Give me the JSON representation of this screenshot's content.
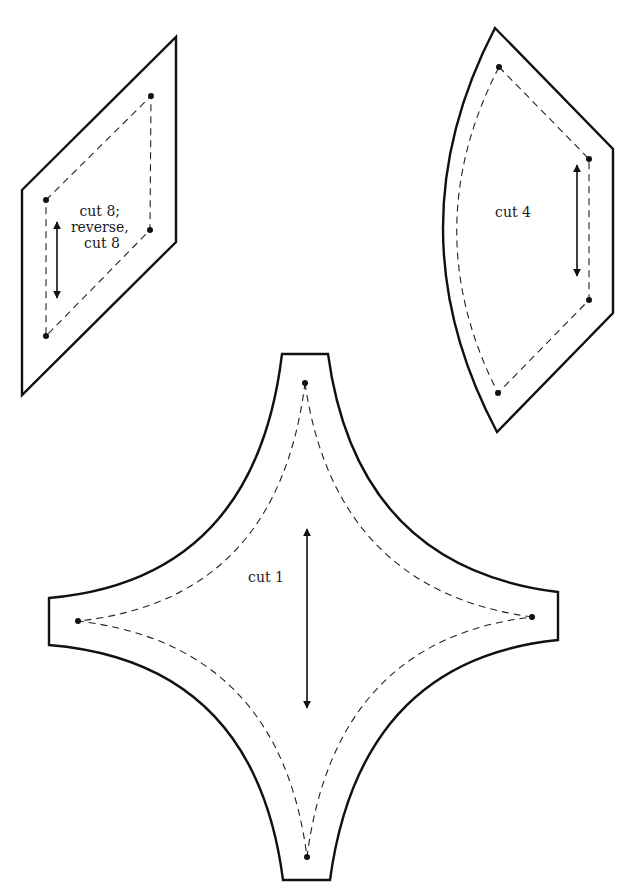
{
  "diagram": {
    "type": "quilt-pattern-templates",
    "colors": {
      "line": "#111111",
      "background": "#ffffff"
    },
    "pieces": [
      {
        "id": "diamond",
        "shape": "parallelogram",
        "label_lines": [
          "cut 8;",
          "reverse,",
          "cut 8"
        ],
        "has_grain_arrow": true
      },
      {
        "id": "arc",
        "shape": "curved-pentagon",
        "label_lines": [
          "cut 4"
        ],
        "has_grain_arrow": true
      },
      {
        "id": "center",
        "shape": "four-point-concave-star",
        "label_lines": [
          "cut 1"
        ],
        "has_grain_arrow": true
      }
    ]
  }
}
